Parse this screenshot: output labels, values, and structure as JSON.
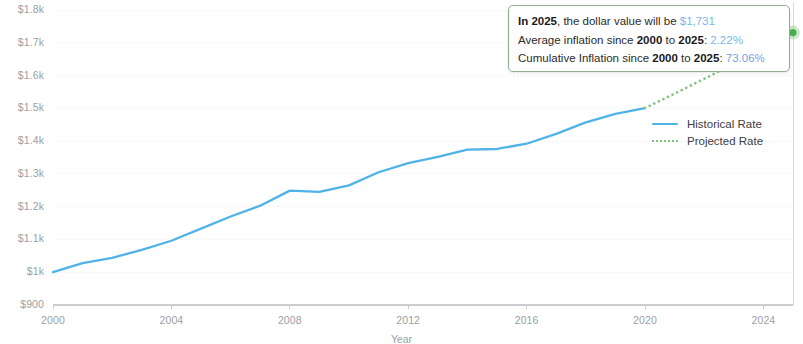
{
  "chart_data": {
    "type": "line",
    "title": "",
    "xlabel": "Year",
    "ylabel": "",
    "xlim": [
      2000,
      2025
    ],
    "ylim": [
      900,
      1800
    ],
    "grid": true,
    "legend_position": "right",
    "xticks": [
      "2000",
      "2004",
      "2008",
      "2012",
      "2016",
      "2020",
      "2024"
    ],
    "xtick_values": [
      2000,
      2004,
      2008,
      2012,
      2016,
      2020,
      2024
    ],
    "yticks": [
      "$900",
      "$1k",
      "$1.1k",
      "$1.2k",
      "$1.3k",
      "$1.4k",
      "$1.5k",
      "$1.6k",
      "$1.7k",
      "$1.8k"
    ],
    "ytick_values": [
      900,
      1000,
      1100,
      1200,
      1300,
      1400,
      1500,
      1600,
      1700,
      1800
    ],
    "series": [
      {
        "name": "Historical Rate",
        "color": "#4FB3E8",
        "style": "solid",
        "x": [
          2000,
          2001,
          2002,
          2003,
          2004,
          2005,
          2006,
          2007,
          2008,
          2009,
          2010,
          2011,
          2012,
          2013,
          2014,
          2015,
          2016,
          2017,
          2018,
          2019,
          2020
        ],
        "values": [
          1000,
          1028,
          1044,
          1068,
          1096,
          1133,
          1170,
          1203,
          1249,
          1245,
          1265,
          1305,
          1333,
          1352,
          1374,
          1376,
          1392,
          1422,
          1457,
          1483,
          1501
        ]
      },
      {
        "name": "Projected Rate",
        "color": "#7ec47e",
        "style": "dotted",
        "x": [
          2020,
          2021,
          2022,
          2023,
          2024,
          2025
        ],
        "values": [
          1501,
          1545,
          1590,
          1636,
          1683,
          1731
        ]
      }
    ],
    "marker": {
      "x": 2025,
      "y": 1731,
      "color": "#4caf50"
    }
  },
  "tooltip": {
    "line1_prefix": "In 2025",
    "line1_mid": ", the dollar value will be ",
    "line1_value": "$1,731",
    "line2_a": "Average inflation since ",
    "line2_b": "2000",
    "line2_c": " to ",
    "line2_d": "2025",
    "line2_e": ": ",
    "line2_value": "2.22%",
    "line3_a": "Cumulative Inflation since ",
    "line3_b": "2000",
    "line3_c": " to ",
    "line3_d": "2025",
    "line3_e": ": ",
    "line3_value": "73.06%"
  },
  "legend": {
    "items": [
      {
        "label": "Historical Rate"
      },
      {
        "label": "Projected Rate"
      }
    ]
  },
  "axis": {
    "x_title": "Year"
  },
  "colors": {
    "historical": "#4FB3E8",
    "projected": "#7ec47e",
    "marker": "#4caf50",
    "grid": "#e8e8e8",
    "tick_text": "#9aa0a6",
    "tooltip_border": "#8fae92"
  }
}
